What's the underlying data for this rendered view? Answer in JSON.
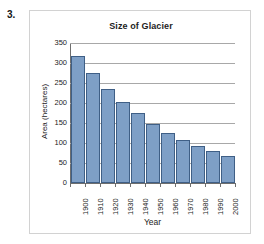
{
  "question": {
    "number": "3."
  },
  "chart_data": {
    "type": "bar",
    "title": "Size of Glacier",
    "xlabel": "Year",
    "ylabel": "Area (hectares)",
    "categories": [
      "1900",
      "1910",
      "1920",
      "1930",
      "1940",
      "1950",
      "1960",
      "1970",
      "1980",
      "1990",
      "2000"
    ],
    "values": [
      318,
      274,
      236,
      202,
      174,
      148,
      126,
      108,
      93,
      79,
      68
    ],
    "ylim": [
      0,
      350
    ],
    "ytick_labels": [
      "350",
      "300",
      "250",
      "200",
      "150",
      "100",
      "50",
      "0"
    ],
    "ytick_values": [
      350,
      300,
      250,
      200,
      150,
      100,
      50,
      0
    ],
    "ytick_step": 50,
    "grid": true,
    "legend": false,
    "bar_fill_color": "#7e9fc6",
    "bar_border_color": "#3f5f86",
    "gridline_color": "#a8a8a8",
    "axis_color": "#6e6e6e",
    "frame_color": "#d2d2d2",
    "background_color": "#ffffff"
  }
}
